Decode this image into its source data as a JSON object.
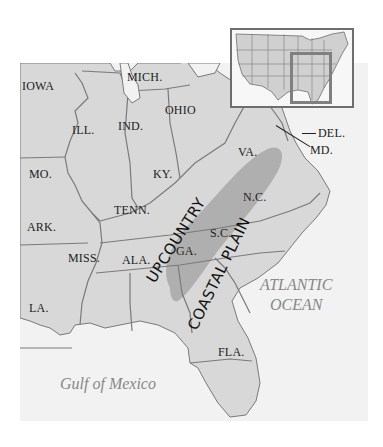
{
  "map": {
    "title": "Upcountry and Coastal Plain of the Southeastern United States",
    "colors": {
      "land": "#d8d8d8",
      "border": "#7a7a7a",
      "ocean": "#f2f2f2",
      "upcountry_band": "#a8a8a8",
      "text": "#222222",
      "water_text": "#888888"
    },
    "states": [
      {
        "abbr": "IOWA"
      },
      {
        "abbr": "MICH."
      },
      {
        "abbr": "ILL."
      },
      {
        "abbr": "IND."
      },
      {
        "abbr": "OHIO"
      },
      {
        "abbr": "MO."
      },
      {
        "abbr": "KY."
      },
      {
        "abbr": "VA."
      },
      {
        "abbr": "DEL."
      },
      {
        "abbr": "MD."
      },
      {
        "abbr": "TENN."
      },
      {
        "abbr": "N.C."
      },
      {
        "abbr": "ARK."
      },
      {
        "abbr": "S.C."
      },
      {
        "abbr": "MISS."
      },
      {
        "abbr": "ALA."
      },
      {
        "abbr": "GA."
      },
      {
        "abbr": "LA."
      },
      {
        "abbr": "FLA."
      }
    ],
    "regions": [
      {
        "name": "UPCOUNTRY"
      },
      {
        "name": "COASTAL PLAIN"
      }
    ],
    "water_bodies": [
      {
        "name_line1": "ATLANTIC",
        "name_line2": "OCEAN"
      },
      {
        "name": "Gulf of Mexico"
      }
    ],
    "inset": {
      "description": "Locator map of the contiguous United States with the southeastern region highlighted"
    }
  }
}
